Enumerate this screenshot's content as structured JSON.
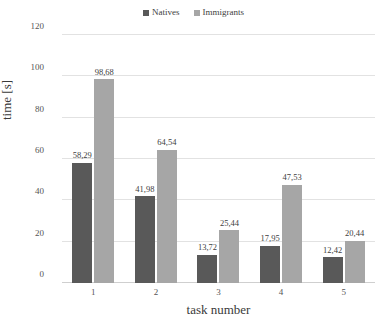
{
  "chart_data": {
    "type": "bar",
    "title": "",
    "xlabel": "task number",
    "ylabel": "time [s]",
    "categories": [
      "1",
      "2",
      "3",
      "4",
      "5"
    ],
    "ylim": [
      0,
      120
    ],
    "yticks": [
      "0",
      "20",
      "40",
      "60",
      "80",
      "100",
      "120"
    ],
    "grid": true,
    "legend_position": "top-center",
    "series": [
      {
        "name": "Natives",
        "color": "#595959",
        "values": [
          58.29,
          41.98,
          13.72,
          17.95,
          12.42
        ],
        "labels": [
          "58,29",
          "41,98",
          "13,72",
          "17,95",
          "12,42"
        ]
      },
      {
        "name": "Immigrants",
        "color": "#a6a6a6",
        "values": [
          98.68,
          64.54,
          25.44,
          47.53,
          20.44
        ],
        "labels": [
          "98,68",
          "64,54",
          "25,44",
          "47,53",
          "20,44"
        ]
      }
    ]
  },
  "colors": {
    "grid": "#e2e2e2",
    "axis_text": "#555555",
    "label_text": "#3a3a3a",
    "background": "#ffffff"
  }
}
